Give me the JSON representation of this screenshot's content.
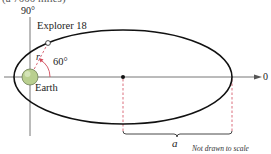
{
  "figure": {
    "top_caption_fragment": "(a 7000 miles)",
    "angle_top_label": "90°",
    "satellite_label": "Explorer 18",
    "radius_label": "r",
    "angle_label": "60°",
    "planet_label": "Earth",
    "angle_zero_label": "0",
    "semi_major_axis_label": "a",
    "note": "Not drawn to scale"
  },
  "colors": {
    "axis": "#555555",
    "orbit": "#111111",
    "dashed_accent": "#d24a5a",
    "earth_fill": "#b9cf8f",
    "earth_stroke": "#6d7f55"
  }
}
